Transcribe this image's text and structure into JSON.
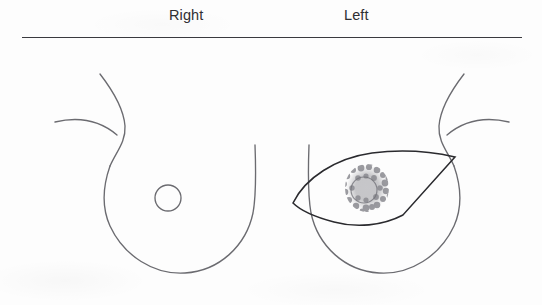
{
  "header": {
    "right_label": "Right",
    "left_label": "Left"
  },
  "divider": {
    "name": "horizontal-rule",
    "color": "#3a3a3f"
  },
  "colors": {
    "background": "#fdfdfd",
    "body_outline": "#6b6b70",
    "excision_outline": "#2a2a2e",
    "tumor_stipple": "#8a8a90",
    "label_text": "#2f2f33"
  },
  "diagram": {
    "type": "medical-illustration",
    "right_breast": {
      "nipple": {
        "shape": "circle-outline",
        "cx": 168,
        "cy": 198,
        "r": 13
      },
      "lesion": null,
      "excision_outline": null
    },
    "left_breast": {
      "nipple": {
        "shape": "hidden-behind-tumor"
      },
      "lesion": {
        "shape": "stippled-mass",
        "cx": 367,
        "cy": 188,
        "width": 42,
        "height": 46,
        "inner_circle_r": 13
      },
      "excision_outline": {
        "shape": "lens",
        "left_vertex": [
          293,
          203
        ],
        "right_tip": [
          455,
          157
        ]
      }
    }
  }
}
